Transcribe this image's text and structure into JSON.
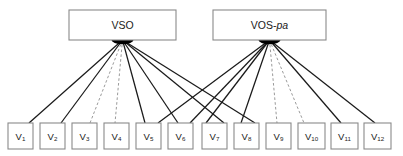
{
  "diagram": {
    "type": "path-diagram",
    "background_color": "#ffffff",
    "width": 403,
    "height": 156,
    "edge_solid_color": "#1a1a1a",
    "edge_dashed_color": "#9a9a9a",
    "box_stroke_color": "#8a8a8a",
    "box_fill_color": "#ffffff",
    "hub_color": "#000000"
  },
  "factors": [
    {
      "id": "vso",
      "label": "VSO",
      "label_plain": "VSO",
      "label_italic": "",
      "x": 69,
      "y": 10,
      "width": 107,
      "height": 30,
      "hub_x": 122.5,
      "hub_y": 40
    },
    {
      "id": "vos_pa",
      "label": "VOS-pa",
      "label_plain": "VOS-",
      "label_italic": "pa",
      "x": 213,
      "y": 10,
      "width": 113,
      "height": 30,
      "hub_x": 269.5,
      "hub_y": 40
    }
  ],
  "indicators": [
    {
      "id": "v1",
      "label_plain": "V",
      "label_sub": "1",
      "x": 8,
      "y": 123,
      "width": 25,
      "height": 26
    },
    {
      "id": "v2",
      "label_plain": "V",
      "label_sub": "2",
      "x": 40,
      "y": 123,
      "width": 25,
      "height": 26
    },
    {
      "id": "v3",
      "label_plain": "V",
      "label_sub": "3",
      "x": 72,
      "y": 123,
      "width": 25,
      "height": 26
    },
    {
      "id": "v4",
      "label_plain": "V",
      "label_sub": "4",
      "x": 104,
      "y": 123,
      "width": 25,
      "height": 26
    },
    {
      "id": "v5",
      "label_plain": "V",
      "label_sub": "5",
      "x": 136,
      "y": 123,
      "width": 25,
      "height": 26
    },
    {
      "id": "v6",
      "label_plain": "V",
      "label_sub": "6",
      "x": 168,
      "y": 123,
      "width": 25,
      "height": 26
    },
    {
      "id": "v7",
      "label_plain": "V",
      "label_sub": "7",
      "x": 202,
      "y": 123,
      "width": 25,
      "height": 26
    },
    {
      "id": "v8",
      "label_plain": "V",
      "label_sub": "8",
      "x": 234,
      "y": 123,
      "width": 25,
      "height": 26
    },
    {
      "id": "v9",
      "label_plain": "V",
      "label_sub": "9",
      "x": 266,
      "y": 123,
      "width": 25,
      "height": 26
    },
    {
      "id": "v10",
      "label_plain": "V",
      "label_sub": "10",
      "x": 298,
      "y": 123,
      "width": 27,
      "height": 26
    },
    {
      "id": "v11",
      "label_plain": "V",
      "label_sub": "11",
      "x": 331,
      "y": 123,
      "width": 27,
      "height": 26
    },
    {
      "id": "v12",
      "label_plain": "V",
      "label_sub": "12",
      "x": 364,
      "y": 123,
      "width": 27,
      "height": 26
    }
  ],
  "edges": [
    {
      "from": "vso",
      "to": "v1",
      "style": "solid",
      "x1": 122.5,
      "y1": 40,
      "x2": 29,
      "y2": 123
    },
    {
      "from": "vso",
      "to": "v2",
      "style": "solid",
      "x1": 122.5,
      "y1": 40,
      "x2": 61,
      "y2": 123
    },
    {
      "from": "vso",
      "to": "v3",
      "style": "dashed",
      "x1": 122.5,
      "y1": 40,
      "x2": 90,
      "y2": 123
    },
    {
      "from": "vso",
      "to": "v4",
      "style": "dashed",
      "x1": 122.5,
      "y1": 40,
      "x2": 115,
      "y2": 123
    },
    {
      "from": "vso",
      "to": "v5",
      "style": "solid",
      "x1": 122.5,
      "y1": 40,
      "x2": 145,
      "y2": 123
    },
    {
      "from": "vso",
      "to": "v6",
      "style": "solid",
      "x1": 122.5,
      "y1": 40,
      "x2": 178,
      "y2": 123
    },
    {
      "from": "vso",
      "to": "v7",
      "style": "solid",
      "x1": 122.5,
      "y1": 40,
      "x2": 224,
      "y2": 123
    },
    {
      "from": "vso",
      "to": "v8",
      "style": "solid",
      "x1": 122.5,
      "y1": 40,
      "x2": 255,
      "y2": 123
    },
    {
      "from": "vos_pa",
      "to": "v5",
      "style": "solid",
      "x1": 269.5,
      "y1": 40,
      "x2": 158,
      "y2": 123
    },
    {
      "from": "vos_pa",
      "to": "v6",
      "style": "solid",
      "x1": 269.5,
      "y1": 40,
      "x2": 190,
      "y2": 123
    },
    {
      "from": "vos_pa",
      "to": "v7",
      "style": "solid",
      "x1": 269.5,
      "y1": 40,
      "x2": 206,
      "y2": 123
    },
    {
      "from": "vos_pa",
      "to": "v8",
      "style": "solid",
      "x1": 269.5,
      "y1": 40,
      "x2": 241,
      "y2": 123
    },
    {
      "from": "vos_pa",
      "to": "v9",
      "style": "dashed",
      "x1": 269.5,
      "y1": 40,
      "x2": 277,
      "y2": 123
    },
    {
      "from": "vos_pa",
      "to": "v10",
      "style": "dashed",
      "x1": 269.5,
      "y1": 40,
      "x2": 304,
      "y2": 123
    },
    {
      "from": "vos_pa",
      "to": "v11",
      "style": "solid",
      "x1": 269.5,
      "y1": 40,
      "x2": 341,
      "y2": 123
    },
    {
      "from": "vos_pa",
      "to": "v12",
      "style": "solid",
      "x1": 269.5,
      "y1": 40,
      "x2": 375,
      "y2": 123
    }
  ]
}
